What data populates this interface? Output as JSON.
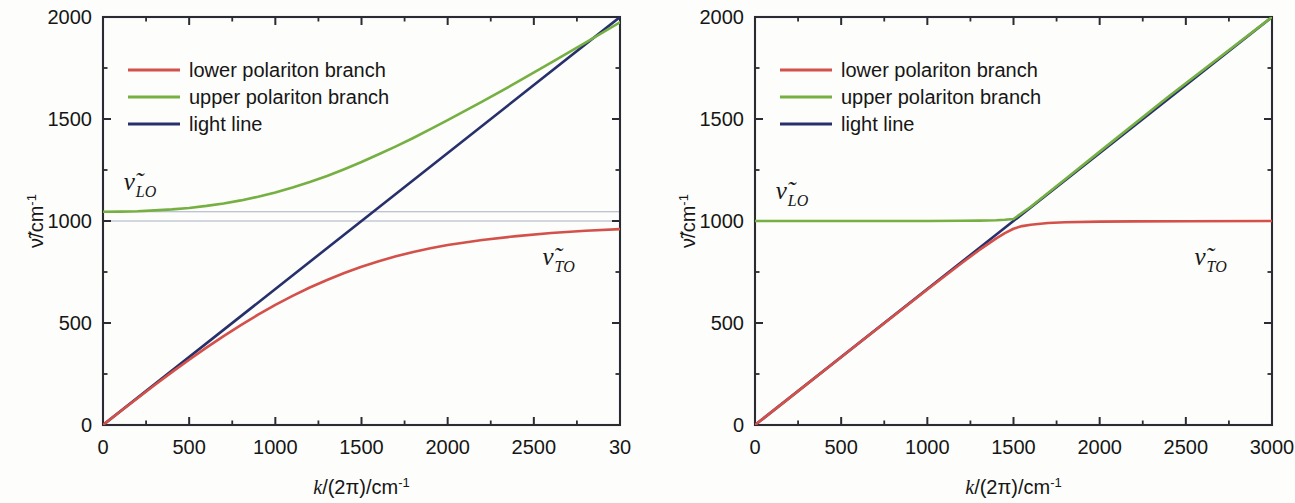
{
  "figure": {
    "background_color": "#fdfdfb",
    "panel_count": 2
  },
  "colors": {
    "lower_branch": "#d4504a",
    "upper_branch": "#76b043",
    "light_line": "#27306b",
    "reference_line": "#9aa3b8",
    "axis": "#2b2b33",
    "text": "#161616"
  },
  "legend": {
    "items": [
      {
        "label": "lower polariton branch",
        "color_key": "lower_branch"
      },
      {
        "label": "upper polariton branch",
        "color_key": "upper_branch"
      },
      {
        "label": "light line",
        "color_key": "light_line"
      }
    ]
  },
  "axes": {
    "ylabel": "ν̃/cm",
    "ylabel_exponent": "-1",
    "xlabel_prefix": "k",
    "xlabel_mid": "/(2π)/cm",
    "xlabel_exponent": "-1",
    "yticks": [
      "0",
      "500",
      "1000",
      "1500",
      "2000"
    ],
    "ytick_values": [
      0,
      500,
      1000,
      1500,
      2000
    ],
    "xticks_full": [
      "0",
      "500",
      "1000",
      "1500",
      "2000",
      "2500",
      "3000"
    ],
    "xtick_values": [
      0,
      500,
      1000,
      1500,
      2000,
      2500,
      3000
    ],
    "xticks_left_panel": [
      "0",
      "500",
      "1000",
      "1500",
      "2000",
      "2500",
      "30"
    ],
    "ylim": [
      0,
      2000
    ],
    "xlim": [
      0,
      3000
    ],
    "minor_ticks_per_interval": 1
  },
  "annotations": {
    "lo_symbol": "ν̃",
    "lo_subscript": "LO",
    "to_symbol": "ν̃",
    "to_subscript": "TO"
  },
  "panels": [
    {
      "id": "left",
      "name": "strong-coupling-panel",
      "lo_value": 1045,
      "to_value": 1000,
      "xtick_labels": [
        "0",
        "500",
        "1000",
        "1500",
        "2000",
        "2500",
        "30"
      ],
      "x_last_label_truncated": true,
      "reference_lines": [
        1045,
        1000
      ],
      "lo_label_x": 120,
      "to_label_x": 2550
    },
    {
      "id": "right",
      "name": "weak-coupling-panel",
      "lo_value": 1000,
      "to_value": 1000,
      "xtick_labels": [
        "0",
        "500",
        "1000",
        "1500",
        "2000",
        "2500",
        "3000"
      ],
      "x_last_label_truncated": false,
      "reference_lines": [],
      "lo_label_x": 120,
      "to_label_x": 2550
    }
  ],
  "chart_data": [
    {
      "type": "line",
      "panel": "left",
      "title": "",
      "xlabel": "k/(2π)/cm-1",
      "ylabel": "ν̃/cm-1",
      "xlim": [
        0,
        3000
      ],
      "ylim": [
        0,
        2000
      ],
      "grid": false,
      "legend_position": "upper-left-inside",
      "nu_LO": 1045,
      "nu_TO": 1000,
      "light_line_slope": 0.6667,
      "series": [
        {
          "name": "lower polariton branch",
          "color": "#d4504a",
          "x": [
            0,
            100,
            200,
            300,
            400,
            500,
            600,
            700,
            800,
            900,
            1000,
            1100,
            1200,
            1300,
            1400,
            1500,
            1600,
            1700,
            1800,
            1900,
            2000,
            2200,
            2400,
            2600,
            2800,
            3000
          ],
          "y": [
            0,
            66,
            131,
            196,
            259,
            320,
            379,
            436,
            490,
            541,
            589,
            633,
            674,
            711,
            745,
            776,
            803,
            827,
            848,
            866,
            882,
            907,
            926,
            941,
            952,
            960
          ]
        },
        {
          "name": "upper polariton branch",
          "color": "#76b043",
          "x": [
            0,
            100,
            200,
            300,
            400,
            500,
            600,
            700,
            800,
            900,
            1000,
            1100,
            1200,
            1300,
            1400,
            1500,
            1600,
            1700,
            1800,
            1900,
            2000,
            2200,
            2400,
            2600,
            2800,
            3000
          ],
          "y": [
            1045,
            1046,
            1048,
            1052,
            1057,
            1064,
            1074,
            1086,
            1101,
            1119,
            1140,
            1164,
            1191,
            1221,
            1254,
            1289,
            1327,
            1366,
            1407,
            1450,
            1494,
            1585,
            1679,
            1776,
            1874,
            1974
          ]
        },
        {
          "name": "light line",
          "color": "#27306b",
          "x": [
            0,
            3000
          ],
          "y": [
            0,
            2000
          ]
        }
      ]
    },
    {
      "type": "line",
      "panel": "right",
      "title": "",
      "xlabel": "k/(2π)/cm-1",
      "ylabel": "ν̃/cm-1",
      "xlim": [
        0,
        3000
      ],
      "ylim": [
        0,
        2000
      ],
      "grid": false,
      "legend_position": "upper-left-inside",
      "nu_LO": 1000,
      "nu_TO": 1000,
      "light_line_slope": 0.6667,
      "series": [
        {
          "name": "lower polariton branch",
          "color": "#d4504a",
          "x": [
            0,
            200,
            400,
            600,
            800,
            1000,
            1200,
            1300,
            1400,
            1450,
            1500,
            1550,
            1600,
            1700,
            1800,
            2000,
            2200,
            2500,
            3000
          ],
          "y": [
            0,
            133,
            266,
            399,
            532,
            664,
            794,
            857,
            915,
            941,
            962,
            975,
            982,
            990,
            994,
            997,
            998,
            999,
            1000
          ]
        },
        {
          "name": "upper polariton branch",
          "color": "#76b043",
          "x": [
            0,
            200,
            400,
            600,
            800,
            1000,
            1200,
            1300,
            1400,
            1450,
            1500,
            1600,
            1800,
            2000,
            2400,
            3000
          ],
          "y": [
            1000,
            1000,
            1000,
            1000,
            1000,
            1000,
            1001,
            1002,
            1004,
            1006,
            1010,
            1070,
            1205,
            1340,
            1610,
            2000
          ]
        },
        {
          "name": "light line",
          "color": "#27306b",
          "x": [
            0,
            3000
          ],
          "y": [
            0,
            2000
          ]
        }
      ]
    }
  ]
}
